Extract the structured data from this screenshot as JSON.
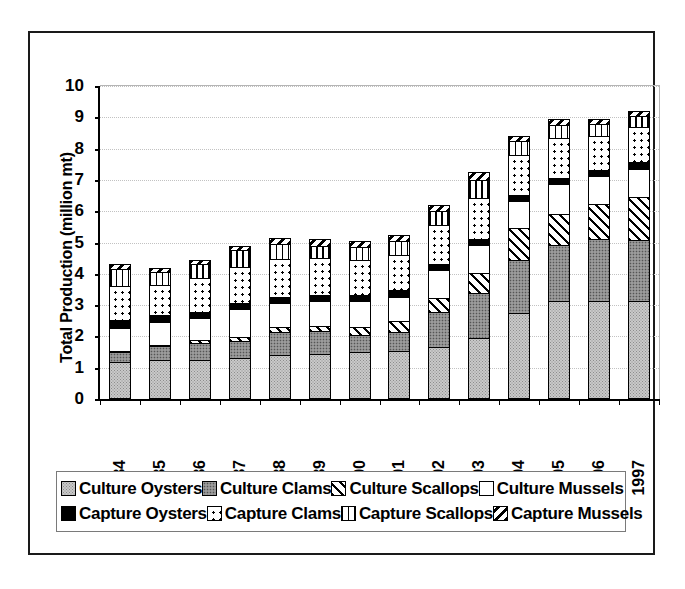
{
  "chart_data": {
    "type": "bar",
    "stacked": true,
    "title": "",
    "xlabel": "",
    "ylabel": "Total Production (million mt)",
    "ylim": [
      0,
      10
    ],
    "ytick_labels": [
      "0",
      "1",
      "2",
      "3",
      "4",
      "5",
      "6",
      "7",
      "8",
      "9",
      "10"
    ],
    "grid": true,
    "legend_position": "bottom",
    "categories": [
      "1984",
      "1985",
      "1986",
      "1987",
      "1988",
      "1989",
      "1990",
      "1991",
      "1992",
      "1993",
      "1994",
      "1995",
      "1996",
      "1997"
    ],
    "series": [
      {
        "name": "Culture Oysters",
        "pattern": "light-gray-dotted",
        "values": [
          1.15,
          1.2,
          1.2,
          1.25,
          1.35,
          1.4,
          1.45,
          1.5,
          1.6,
          1.9,
          2.7,
          3.1,
          3.1,
          3.1
        ]
      },
      {
        "name": "Culture Clams",
        "pattern": "dark-gray-dotted",
        "values": [
          0.3,
          0.45,
          0.55,
          0.55,
          0.75,
          0.75,
          0.55,
          0.6,
          1.15,
          1.45,
          1.7,
          1.8,
          2.0,
          1.95
        ]
      },
      {
        "name": "Culture Scallops",
        "pattern": "diagonal-backslash",
        "values": [
          0.05,
          0.05,
          0.1,
          0.15,
          0.15,
          0.15,
          0.25,
          0.35,
          0.45,
          0.65,
          1.05,
          1.0,
          1.1,
          1.4
        ]
      },
      {
        "name": "Culture Mussels",
        "pattern": "white",
        "values": [
          0.75,
          0.75,
          0.7,
          0.9,
          0.8,
          0.8,
          0.85,
          0.8,
          0.9,
          0.9,
          0.85,
          0.95,
          0.9,
          0.9
        ]
      },
      {
        "name": "Capture Oysters",
        "pattern": "solid-black",
        "values": [
          0.25,
          0.2,
          0.2,
          0.2,
          0.2,
          0.2,
          0.2,
          0.2,
          0.2,
          0.2,
          0.2,
          0.2,
          0.2,
          0.2
        ]
      },
      {
        "name": "Capture Clams",
        "pattern": "white-dotted",
        "values": [
          1.1,
          1.0,
          1.1,
          1.15,
          1.2,
          1.2,
          1.15,
          1.15,
          1.25,
          1.3,
          1.3,
          1.3,
          1.1,
          1.15
        ]
      },
      {
        "name": "Capture Scallops",
        "pattern": "vertical-lines",
        "values": [
          0.55,
          0.4,
          0.45,
          0.55,
          0.5,
          0.4,
          0.4,
          0.45,
          0.45,
          0.6,
          0.45,
          0.4,
          0.4,
          0.35
        ]
      },
      {
        "name": "Capture Mussels",
        "pattern": "diagonal-slash",
        "values": [
          0.15,
          0.15,
          0.15,
          0.15,
          0.2,
          0.2,
          0.2,
          0.2,
          0.2,
          0.25,
          0.15,
          0.2,
          0.15,
          0.15
        ]
      }
    ],
    "totals": [
      4.3,
      4.2,
      4.45,
      4.9,
      5.15,
      5.1,
      5.05,
      5.25,
      6.2,
      7.25,
      8.4,
      9.0,
      8.95,
      9.2
    ]
  },
  "legend": {
    "row1": [
      {
        "label": "Culture Oysters",
        "swatch": "p-culture-oysters"
      },
      {
        "label": "Culture Clams",
        "swatch": "p-culture-clams"
      },
      {
        "label": "Culture Scallops",
        "swatch": "p-culture-scallops"
      },
      {
        "label": "Culture Mussels",
        "swatch": "p-culture-mussels"
      }
    ],
    "row2": [
      {
        "label": "Capture Oysters",
        "swatch": "p-capture-oysters"
      },
      {
        "label": "Capture Clams",
        "swatch": "p-capture-clams"
      },
      {
        "label": "Capture Scallops",
        "swatch": "p-capture-scallops"
      },
      {
        "label": "Capture Mussels",
        "swatch": "p-capture-mussels"
      }
    ]
  },
  "colors": {
    "axis": "#000000",
    "grid": "#c2c2c2",
    "frame": "#1a1a1a",
    "background": "#ffffff"
  }
}
